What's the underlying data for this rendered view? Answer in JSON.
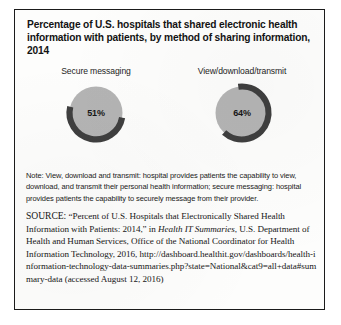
{
  "figure": {
    "title": "Percentage of U.S. hospitals that shared electronic health information with patients, by method of sharing information, 2014",
    "note": "Note: View, download and transmit: hospital provides patients the capability to view, download, and transmit their personal health information; secure messaging: hospital provides patients the capability to securely message from their provider.",
    "source": {
      "label": "SOURCE:",
      "title_quoted": "“Percent of U.S. Hospitals that Electronically Shared Health Information with Patients: 2014,”",
      "in_word": "in",
      "publication_italic": "Health IT Summaries",
      "publisher": ", U.S. Department of Health and Human Services, Office of the National Coordinator for Health Information Technology, 2016, ",
      "url": "http://dashboard.healthit.gov/dashboards/health-information-technology-data-summaries.php?state=National&cat9=all+data#summary-data",
      "accessed": "(accessed August 12, 2016)"
    }
  },
  "chart_data": [
    {
      "type": "pie",
      "title": "Secure messaging",
      "categories": [
        "Shared",
        "Did not share"
      ],
      "values": [
        51,
        49
      ],
      "value_label": "51%",
      "unit": "%",
      "ring_color": "#3f3f3f",
      "disc_color": "#b4b4b4",
      "start_angle_deg": 100,
      "sweep_deg": 183.6
    },
    {
      "type": "pie",
      "title": "View/download/transmit",
      "categories": [
        "Shared",
        "Did not share"
      ],
      "values": [
        64,
        36
      ],
      "value_label": "64%",
      "unit": "%",
      "ring_color": "#3f3f3f",
      "disc_color": "#b4b4b4",
      "start_angle_deg": 352,
      "sweep_deg": 230.4
    }
  ],
  "colors": {
    "border": "#1b1b1b",
    "page_background": "#ffffff",
    "figure_background": "#fdfdfc",
    "disc": "#b4b4b4",
    "arc": "#3f3f3f",
    "text": "#161616"
  }
}
